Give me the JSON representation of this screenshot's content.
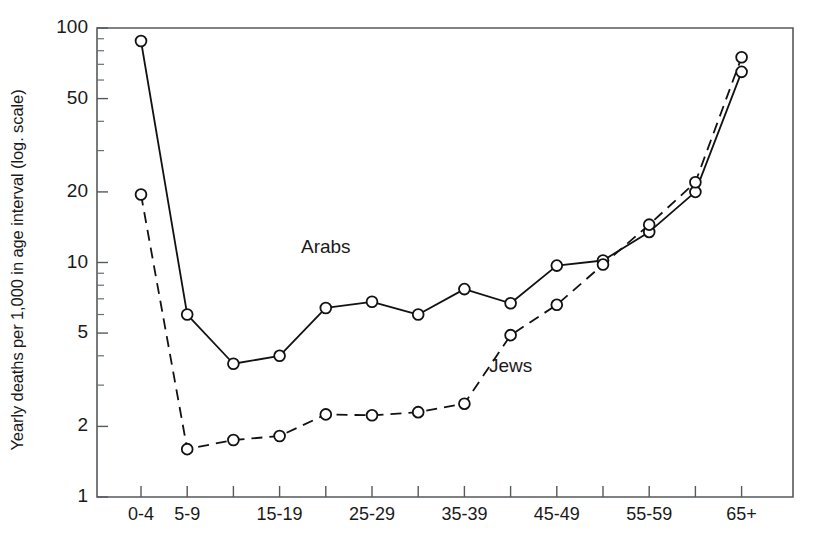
{
  "chart_data": {
    "type": "line",
    "title": "",
    "xlabel": "",
    "ylabel": "Yearly deaths per 1,000 in age interval (log. scale)",
    "yscale": "log",
    "ylim": [
      1,
      100
    ],
    "ytick_values": [
      1,
      2,
      5,
      10,
      20,
      50,
      100
    ],
    "ytick_labels": [
      "1",
      "2",
      "5",
      "10",
      "20",
      "50",
      "100"
    ],
    "yminor_ticks": [
      3,
      4,
      6,
      7,
      8,
      9,
      30,
      40,
      60,
      70,
      80,
      90
    ],
    "grid": false,
    "legend_position": "inline-annotations",
    "categories": [
      "0-4",
      "5-9",
      "10-14",
      "15-19",
      "20-24",
      "25-29",
      "30-34",
      "35-39",
      "40-44",
      "45-49",
      "50-54",
      "55-59",
      "60-64",
      "65+"
    ],
    "xtick_labels_shown": [
      "0-4",
      "5-9",
      "",
      "15-19",
      "",
      "25-29",
      "",
      "35-39",
      "",
      "45-49",
      "",
      "55-59",
      "",
      "65+"
    ],
    "series": [
      {
        "name": "Arabs",
        "style": "solid",
        "marker": "open-circle",
        "color": "#121212",
        "values": [
          88,
          6.0,
          3.7,
          4.0,
          6.4,
          6.8,
          6.0,
          7.7,
          6.7,
          9.7,
          10.2,
          13.5,
          20.0,
          65
        ]
      },
      {
        "name": "Jews",
        "style": "dashed",
        "marker": "open-circle",
        "color": "#121212",
        "values": [
          19.5,
          1.6,
          1.75,
          1.82,
          2.25,
          2.23,
          2.3,
          2.5,
          4.9,
          6.6,
          9.8,
          14.5,
          22.0,
          75
        ]
      }
    ],
    "annotations": [
      {
        "text": "Arabs",
        "x_value": "20-24",
        "y_value": 11.5
      },
      {
        "text": "Jews",
        "x_value": "40-44",
        "y_value": 3.6
      }
    ]
  }
}
